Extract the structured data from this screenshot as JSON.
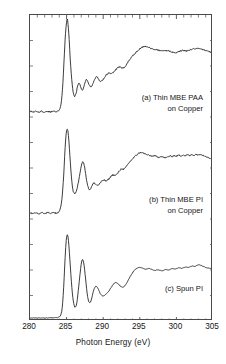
{
  "figure": {
    "background_color": "#ffffff",
    "frame_color": "#4a4a4a",
    "curve_color": "#1a1a1a"
  },
  "axes": {
    "xlabel": "Photon Energy  (eV)",
    "ylabel": "Secondary Electron Yield  (arbitrary units)",
    "xticklabels": [
      "280",
      "285",
      "290",
      "295",
      "300",
      "305"
    ],
    "xlim": [
      280,
      305
    ],
    "ylim": [
      0,
      3
    ],
    "xticks": [
      280,
      285,
      290,
      295,
      300,
      305
    ],
    "yticks_labeled": false,
    "grid": false,
    "tick_direction": "in"
  },
  "annotations": {
    "a_line1": "(a) Thin MBE PAA",
    "a_line2": "on Copper",
    "b_line1": "(b) Thin MBE PI",
    "b_line2": "on Copper",
    "c_line1": "(c) Spun PI"
  },
  "chart_data": {
    "type": "line",
    "title": "",
    "xlabel": "Photon Energy  (eV)",
    "ylabel": "Secondary Electron Yield  (arbitrary units)",
    "xlim": [
      280,
      305
    ],
    "ylim": [
      0,
      3
    ],
    "grid": false,
    "legend": "inline-annotations",
    "x_unit": "eV",
    "series": [
      {
        "name": "(a) Thin MBE PAA on Copper",
        "offset": 2.0,
        "points": [
          [
            280.0,
            0.055
          ],
          [
            280.4,
            0.05
          ],
          [
            280.8,
            0.058
          ],
          [
            281.2,
            0.048
          ],
          [
            281.6,
            0.056
          ],
          [
            282.0,
            0.046
          ],
          [
            282.4,
            0.055
          ],
          [
            282.8,
            0.05
          ],
          [
            283.2,
            0.058
          ],
          [
            283.6,
            0.052
          ],
          [
            283.9,
            0.062
          ],
          [
            284.1,
            0.085
          ],
          [
            284.3,
            0.16
          ],
          [
            284.5,
            0.34
          ],
          [
            284.7,
            0.62
          ],
          [
            284.85,
            0.82
          ],
          [
            285.0,
            0.93
          ],
          [
            285.1,
            0.96
          ],
          [
            285.2,
            0.905
          ],
          [
            285.35,
            0.76
          ],
          [
            285.5,
            0.56
          ],
          [
            285.7,
            0.37
          ],
          [
            285.9,
            0.245
          ],
          [
            286.1,
            0.2
          ],
          [
            286.3,
            0.235
          ],
          [
            286.5,
            0.3
          ],
          [
            286.7,
            0.33
          ],
          [
            286.9,
            0.3
          ],
          [
            287.1,
            0.262
          ],
          [
            287.3,
            0.282
          ],
          [
            287.5,
            0.33
          ],
          [
            287.7,
            0.368
          ],
          [
            287.9,
            0.348
          ],
          [
            288.1,
            0.312
          ],
          [
            288.35,
            0.296
          ],
          [
            288.6,
            0.33
          ],
          [
            288.85,
            0.372
          ],
          [
            289.1,
            0.392
          ],
          [
            289.35,
            0.372
          ],
          [
            289.6,
            0.352
          ],
          [
            289.9,
            0.36
          ],
          [
            290.2,
            0.392
          ],
          [
            290.5,
            0.418
          ],
          [
            290.8,
            0.43
          ],
          [
            291.1,
            0.428
          ],
          [
            291.4,
            0.44
          ],
          [
            291.8,
            0.47
          ],
          [
            292.2,
            0.49
          ],
          [
            292.6,
            0.478
          ],
          [
            293.0,
            0.496
          ],
          [
            293.4,
            0.54
          ],
          [
            293.8,
            0.58
          ],
          [
            294.2,
            0.612
          ],
          [
            294.6,
            0.642
          ],
          [
            295.0,
            0.668
          ],
          [
            295.4,
            0.686
          ],
          [
            295.8,
            0.692
          ],
          [
            296.2,
            0.684
          ],
          [
            296.6,
            0.672
          ],
          [
            297.0,
            0.664
          ],
          [
            297.4,
            0.658
          ],
          [
            297.8,
            0.65
          ],
          [
            298.2,
            0.646
          ],
          [
            298.6,
            0.652
          ],
          [
            299.0,
            0.648
          ],
          [
            299.4,
            0.636
          ],
          [
            299.8,
            0.63
          ],
          [
            300.2,
            0.638
          ],
          [
            300.6,
            0.648
          ],
          [
            301.0,
            0.652
          ],
          [
            301.4,
            0.648
          ],
          [
            301.8,
            0.656
          ],
          [
            302.2,
            0.664
          ],
          [
            302.6,
            0.668
          ],
          [
            303.0,
            0.672
          ],
          [
            303.4,
            0.668
          ],
          [
            303.8,
            0.656
          ],
          [
            304.2,
            0.646
          ],
          [
            304.6,
            0.638
          ],
          [
            305.0,
            0.632
          ]
        ]
      },
      {
        "name": "(b) Thin MBE PI on Copper",
        "offset": 1.0,
        "points": [
          [
            280.0,
            0.06
          ],
          [
            280.4,
            0.052
          ],
          [
            280.8,
            0.062
          ],
          [
            281.2,
            0.05
          ],
          [
            281.6,
            0.06
          ],
          [
            282.0,
            0.052
          ],
          [
            282.4,
            0.062
          ],
          [
            282.8,
            0.054
          ],
          [
            283.2,
            0.064
          ],
          [
            283.6,
            0.056
          ],
          [
            283.9,
            0.068
          ],
          [
            284.1,
            0.095
          ],
          [
            284.35,
            0.19
          ],
          [
            284.6,
            0.42
          ],
          [
            284.8,
            0.7
          ],
          [
            284.95,
            0.84
          ],
          [
            285.1,
            0.88
          ],
          [
            285.25,
            0.82
          ],
          [
            285.45,
            0.62
          ],
          [
            285.65,
            0.42
          ],
          [
            285.85,
            0.29
          ],
          [
            286.05,
            0.25
          ],
          [
            286.25,
            0.262
          ],
          [
            286.5,
            0.32
          ],
          [
            286.75,
            0.42
          ],
          [
            287.0,
            0.52
          ],
          [
            287.2,
            0.56
          ],
          [
            287.4,
            0.53
          ],
          [
            287.6,
            0.445
          ],
          [
            287.8,
            0.355
          ],
          [
            288.0,
            0.3
          ],
          [
            288.2,
            0.29
          ],
          [
            288.45,
            0.322
          ],
          [
            288.7,
            0.352
          ],
          [
            288.95,
            0.342
          ],
          [
            289.2,
            0.33
          ],
          [
            289.5,
            0.344
          ],
          [
            289.8,
            0.37
          ],
          [
            290.1,
            0.382
          ],
          [
            290.4,
            0.372
          ],
          [
            290.7,
            0.388
          ],
          [
            291.0,
            0.412
          ],
          [
            291.3,
            0.432
          ],
          [
            291.6,
            0.428
          ],
          [
            291.9,
            0.442
          ],
          [
            292.2,
            0.47
          ],
          [
            292.5,
            0.492
          ],
          [
            292.8,
            0.488
          ],
          [
            293.1,
            0.508
          ],
          [
            293.4,
            0.54
          ],
          [
            293.7,
            0.566
          ],
          [
            294.0,
            0.588
          ],
          [
            294.3,
            0.612
          ],
          [
            294.6,
            0.63
          ],
          [
            294.9,
            0.646
          ],
          [
            295.2,
            0.652
          ],
          [
            295.5,
            0.644
          ],
          [
            295.8,
            0.636
          ],
          [
            296.1,
            0.628
          ],
          [
            296.4,
            0.622
          ],
          [
            296.7,
            0.616
          ],
          [
            297.0,
            0.62
          ],
          [
            297.3,
            0.612
          ],
          [
            297.6,
            0.606
          ],
          [
            297.9,
            0.612
          ],
          [
            298.2,
            0.606
          ],
          [
            298.5,
            0.6
          ],
          [
            298.8,
            0.608
          ],
          [
            299.1,
            0.618
          ],
          [
            299.4,
            0.612
          ],
          [
            299.7,
            0.622
          ],
          [
            300.0,
            0.616
          ],
          [
            300.3,
            0.626
          ],
          [
            300.6,
            0.618
          ],
          [
            300.9,
            0.628
          ],
          [
            301.2,
            0.62
          ],
          [
            301.5,
            0.63
          ],
          [
            301.8,
            0.622
          ],
          [
            302.1,
            0.632
          ],
          [
            302.4,
            0.624
          ],
          [
            302.7,
            0.634
          ],
          [
            303.0,
            0.626
          ],
          [
            303.3,
            0.636
          ],
          [
            303.6,
            0.626
          ],
          [
            303.9,
            0.618
          ],
          [
            304.2,
            0.608
          ],
          [
            304.5,
            0.598
          ],
          [
            304.8,
            0.59
          ],
          [
            305.0,
            0.586
          ]
        ]
      },
      {
        "name": "(c) Spun PI",
        "offset": 0.0,
        "points": [
          [
            280.0,
            0.03
          ],
          [
            281.0,
            0.03
          ],
          [
            282.0,
            0.03
          ],
          [
            283.0,
            0.031
          ],
          [
            283.5,
            0.032
          ],
          [
            283.8,
            0.034
          ],
          [
            284.0,
            0.04
          ],
          [
            284.2,
            0.06
          ],
          [
            284.4,
            0.13
          ],
          [
            284.6,
            0.33
          ],
          [
            284.8,
            0.62
          ],
          [
            284.95,
            0.79
          ],
          [
            285.1,
            0.845
          ],
          [
            285.25,
            0.79
          ],
          [
            285.45,
            0.6
          ],
          [
            285.65,
            0.39
          ],
          [
            285.85,
            0.23
          ],
          [
            286.05,
            0.15
          ],
          [
            286.2,
            0.135
          ],
          [
            286.4,
            0.18
          ],
          [
            286.6,
            0.3
          ],
          [
            286.85,
            0.47
          ],
          [
            287.05,
            0.58
          ],
          [
            287.2,
            0.6
          ],
          [
            287.4,
            0.54
          ],
          [
            287.6,
            0.41
          ],
          [
            287.8,
            0.275
          ],
          [
            288.0,
            0.195
          ],
          [
            288.2,
            0.18
          ],
          [
            288.4,
            0.215
          ],
          [
            288.65,
            0.29
          ],
          [
            288.9,
            0.335
          ],
          [
            289.1,
            0.338
          ],
          [
            289.35,
            0.308
          ],
          [
            289.6,
            0.268
          ],
          [
            289.9,
            0.248
          ],
          [
            290.2,
            0.252
          ],
          [
            290.5,
            0.272
          ],
          [
            290.8,
            0.296
          ],
          [
            291.1,
            0.33
          ],
          [
            291.4,
            0.362
          ],
          [
            291.7,
            0.376
          ],
          [
            292.0,
            0.366
          ],
          [
            292.3,
            0.344
          ],
          [
            292.6,
            0.332
          ],
          [
            292.9,
            0.342
          ],
          [
            293.2,
            0.372
          ],
          [
            293.5,
            0.412
          ],
          [
            293.8,
            0.45
          ],
          [
            294.1,
            0.482
          ],
          [
            294.4,
            0.506
          ],
          [
            294.7,
            0.52
          ],
          [
            295.0,
            0.526
          ],
          [
            295.3,
            0.52
          ],
          [
            295.6,
            0.512
          ],
          [
            295.9,
            0.508
          ],
          [
            296.2,
            0.514
          ],
          [
            296.5,
            0.508
          ],
          [
            296.8,
            0.5
          ],
          [
            297.1,
            0.496
          ],
          [
            297.4,
            0.502
          ],
          [
            297.7,
            0.498
          ],
          [
            298.0,
            0.492
          ],
          [
            298.3,
            0.498
          ],
          [
            298.6,
            0.506
          ],
          [
            298.9,
            0.5
          ],
          [
            299.2,
            0.508
          ],
          [
            299.5,
            0.514
          ],
          [
            299.8,
            0.508
          ],
          [
            300.1,
            0.516
          ],
          [
            300.4,
            0.522
          ],
          [
            300.7,
            0.516
          ],
          [
            301.0,
            0.524
          ],
          [
            301.3,
            0.53
          ],
          [
            301.6,
            0.524
          ],
          [
            301.9,
            0.532
          ],
          [
            302.2,
            0.54
          ],
          [
            302.5,
            0.534
          ],
          [
            302.8,
            0.544
          ],
          [
            303.1,
            0.552
          ],
          [
            303.4,
            0.544
          ],
          [
            303.7,
            0.534
          ],
          [
            304.0,
            0.526
          ],
          [
            304.3,
            0.52
          ],
          [
            304.6,
            0.516
          ],
          [
            305.0,
            0.512
          ]
        ]
      }
    ]
  }
}
